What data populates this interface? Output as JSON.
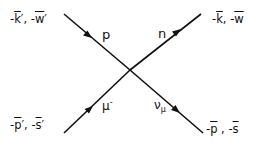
{
  "diagram": {
    "type": "feynman-vertex",
    "lines": [
      {
        "name": "incoming-proton",
        "label": "p",
        "from": [
          64,
          14
        ],
        "to": [
          130,
          70
        ],
        "arrow": "forward"
      },
      {
        "name": "outgoing-neutron",
        "label": "n",
        "from": [
          130,
          70
        ],
        "to": [
          201,
          14
        ],
        "arrow": "forward"
      },
      {
        "name": "incoming-muon",
        "label": "μ⁻",
        "from": [
          64,
          133
        ],
        "to": [
          130,
          70
        ],
        "arrow": "forward"
      },
      {
        "name": "outgoing-neutrino",
        "label": "ν_μ",
        "from": [
          130,
          70
        ],
        "to": [
          203,
          133
        ],
        "arrow": "forward"
      }
    ],
    "labels": {
      "top_left": {
        "minus1": "-",
        "k": "k",
        "prime1": "′",
        "sep": ", -",
        "w": "w",
        "prime2": "′"
      },
      "top_right": {
        "minus1": "-",
        "k": "k",
        "sep": ", -",
        "w": "w"
      },
      "bottom_left": {
        "minus1": "-",
        "p": "p",
        "prime1": "′",
        "sep": ", -",
        "s": "s",
        "prime2": "′"
      },
      "bottom_right": {
        "minus1": "-",
        "p": "p",
        "sep": " , -",
        "s": "s"
      },
      "proton": "p",
      "neutron": "n",
      "muon_base": "μ",
      "muon_charge": "-",
      "neutrino_base": "ν",
      "neutrino_sub": "μ"
    },
    "colors": {
      "line": "#111111",
      "background": "#ffffff"
    }
  }
}
